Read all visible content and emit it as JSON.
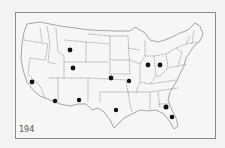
{
  "map": {
    "subject": "Contiguous United States with state boundaries",
    "page_label": "194",
    "colors": {
      "background": "#f3f3f1",
      "frame": "#8a8a8a",
      "border_lines": "#7a7a7a",
      "dots": "#111111"
    },
    "markers": [
      {
        "state": "California",
        "x": 32,
        "y": 82
      },
      {
        "state": "Wyoming",
        "x": 70,
        "y": 50
      },
      {
        "state": "Utah",
        "x": 73,
        "y": 68
      },
      {
        "state": "Arizona",
        "x": 55,
        "y": 101
      },
      {
        "state": "New Mexico",
        "x": 79,
        "y": 100
      },
      {
        "state": "Kansas",
        "x": 111,
        "y": 78
      },
      {
        "state": "Missouri",
        "x": 129,
        "y": 81
      },
      {
        "state": "Texas",
        "x": 116,
        "y": 110
      },
      {
        "state": "Indiana",
        "x": 148,
        "y": 65
      },
      {
        "state": "Ohio",
        "x": 160,
        "y": 65
      },
      {
        "state": "Georgia",
        "x": 166,
        "y": 107
      },
      {
        "state": "Florida",
        "x": 172,
        "y": 117
      }
    ]
  }
}
